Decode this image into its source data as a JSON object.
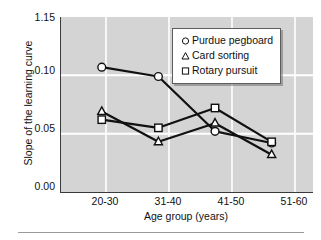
{
  "chart_data": {
    "type": "line",
    "title": "",
    "subtitle": "",
    "xlabel": "Age group (years)",
    "ylabel": "Slope of the learning curve",
    "categories": [
      "20-30",
      "31-40",
      "41-50",
      "51-60"
    ],
    "ytick_labels": [
      "1.15",
      "0.10",
      "0.05",
      "0.00"
    ],
    "ytick_values": [
      0.15,
      0.1,
      0.05,
      0.0
    ],
    "ylim": [
      0.0,
      0.15
    ],
    "grid": "horizontal-and-vertical-white",
    "legend_position": "upper-right",
    "series": [
      {
        "name": "Purdue pegboard",
        "marker": "circle",
        "values": [
          0.107,
          0.099,
          0.052,
          0.042
        ]
      },
      {
        "name": "Card sorting",
        "marker": "triangle",
        "values": [
          0.069,
          0.043,
          0.059,
          0.032
        ]
      },
      {
        "name": "Rotary pursuit",
        "marker": "square",
        "values": [
          0.062,
          0.055,
          0.072,
          0.043
        ]
      }
    ],
    "colors": {
      "plot_background": "#d4d4d4",
      "gridline": "#ffffff",
      "axis": "#3a3a3a",
      "line": "#111111",
      "marker_fill": "#ffffff",
      "text": "#111111",
      "legend_background": "#ffffff"
    }
  },
  "axis": {
    "y_label": "Slope of the learning curve",
    "x_label": "Age group (years)",
    "y_ticks": [
      {
        "label": "1.15"
      },
      {
        "label": "0.10"
      },
      {
        "label": "0.05"
      },
      {
        "label": "0.00"
      }
    ],
    "x_ticks": [
      {
        "label": "20-30"
      },
      {
        "label": "31-40"
      },
      {
        "label": "41-50"
      },
      {
        "label": "51-60"
      }
    ]
  },
  "legend": {
    "entries": [
      {
        "marker": "circle-marker-icon",
        "label": "Purdue pegboard"
      },
      {
        "marker": "triangle-marker-icon",
        "label": "Card sorting"
      },
      {
        "marker": "square-marker-icon",
        "label": "Rotary pursuit"
      }
    ]
  }
}
